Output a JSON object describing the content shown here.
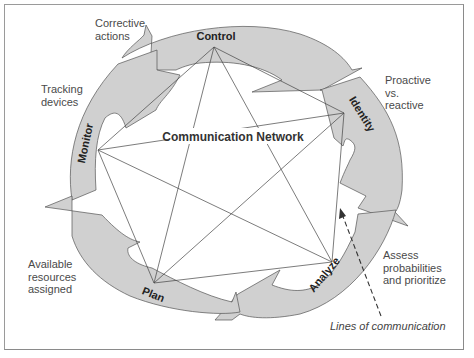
{
  "diagram": {
    "center_label": "Communication Network",
    "stages": [
      {
        "id": "control",
        "label": "Control"
      },
      {
        "id": "identity",
        "label": "Identity"
      },
      {
        "id": "analyze",
        "label": "Analyze"
      },
      {
        "id": "plan",
        "label": "Plan"
      },
      {
        "id": "monitor",
        "label": "Monitor"
      }
    ],
    "annotations": {
      "corrective": "Corrective\nactions",
      "tracking": "Tracking\ndevices",
      "proactive": "Proactive\nvs.\nreactive",
      "assess": "Assess\nprobabilities\nand prioritize",
      "available": "Available\nresources\nassigned",
      "lines": "Lines of communication"
    },
    "colors": {
      "arrow_fill": "#d0d0d0",
      "line": "#444444",
      "text": "#4a4a4a"
    }
  }
}
